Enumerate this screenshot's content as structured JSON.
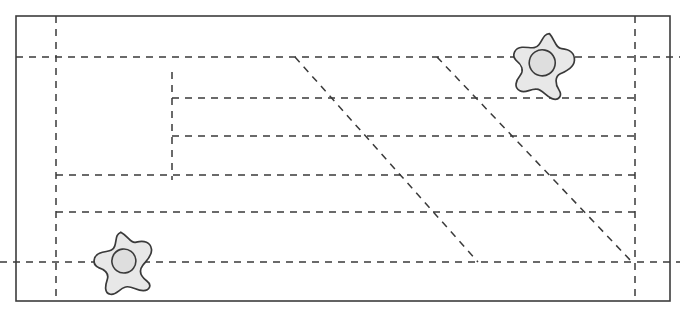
{
  "figure": {
    "canvas": {
      "width": 680,
      "height": 318,
      "background": "#ffffff"
    },
    "colors": {
      "solid_stroke": "#3d3d3d",
      "dashed_stroke": "#3a3a3a",
      "amoeba_fill": "#e8e8e8",
      "nucleus_fill": "#dedede"
    },
    "frame": {
      "name": "outer-rectangle",
      "x": 16,
      "y": 16,
      "width": 654,
      "height": 285,
      "stroke_width": 1.6
    },
    "dash_pattern": "7 6",
    "horizontal_dashed_lines": [
      {
        "id": "h1",
        "y": 57,
        "x1": 16,
        "x2": 680
      },
      {
        "id": "h2",
        "y": 98,
        "x1": 172,
        "x2": 640
      },
      {
        "id": "h3",
        "y": 136,
        "x1": 172,
        "x2": 640
      },
      {
        "id": "h4",
        "y": 175,
        "x1": 56,
        "x2": 640
      },
      {
        "id": "h5",
        "y": 212,
        "x1": 56,
        "x2": 640
      },
      {
        "id": "h6",
        "y": 262,
        "x1": 0,
        "x2": 680
      }
    ],
    "vertical_dashed_lines": [
      {
        "id": "v1",
        "x": 56,
        "y1": 16,
        "y2": 301
      },
      {
        "id": "v2",
        "x": 172,
        "y1": 72,
        "y2": 180
      },
      {
        "id": "v3",
        "x": 635,
        "y1": 16,
        "y2": 301
      }
    ],
    "diagonal_dashed_lines": [
      {
        "id": "d1",
        "x1": 295,
        "y1": 57,
        "x2": 478,
        "y2": 262
      },
      {
        "id": "d2",
        "x1": 437,
        "y1": 57,
        "x2": 632,
        "y2": 262
      }
    ],
    "amoebae": [
      {
        "id": "amoeba-top-right",
        "label": "cell-upper-right",
        "center_x": 543,
        "center_y": 64,
        "radius": 31,
        "nucleus_radius": 13,
        "rotation_deg": 12
      },
      {
        "id": "amoeba-bottom-left",
        "label": "cell-lower-left",
        "center_x": 124,
        "center_y": 262,
        "radius": 30,
        "nucleus_radius": 12,
        "rotation_deg": -8
      }
    ]
  }
}
